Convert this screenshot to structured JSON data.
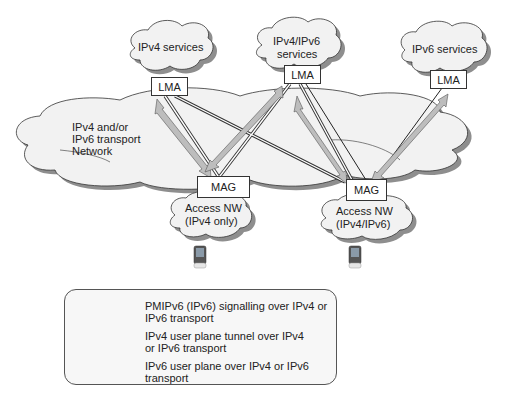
{
  "diagram": {
    "clouds": {
      "ipv4_services": "IPv4 services",
      "ipv4_ipv6_services_line1": "IPv4/IPv6",
      "ipv4_ipv6_services_line2": "services",
      "ipv6_services": "IPv6 services",
      "transport_line1": "IPv4 and/or",
      "transport_line2": "IPv6 transport",
      "transport_line3": "Network",
      "access_v4_line1": "Access NW",
      "access_v4_line2": "(IPv4 only)",
      "access_dual_line1": "Access NW",
      "access_dual_line2": "(IPv4/IPv6)"
    },
    "nodes": {
      "lma1": "LMA",
      "lma2": "LMA",
      "lma3": "LMA",
      "mag1": "MAG",
      "mag2": "MAG"
    }
  },
  "legend": {
    "items": [
      {
        "symbol": "double-arrow",
        "text": "PMIPv6 (IPv6) signalling over IPv4 or IPv6 transport"
      },
      {
        "symbol": "double-line",
        "text": "IPv4 user plane tunnel over IPv4 or IPv6 transport"
      },
      {
        "symbol": "single-line",
        "text": "IPv6 user plane over IPv4 or IPv6 transport"
      }
    ]
  },
  "colors": {
    "cloud_fill": "#f3f3f3",
    "cloud_shadow": "#9a9a9a",
    "arrow_fill": "#bdbdbd",
    "line": "#333333"
  }
}
